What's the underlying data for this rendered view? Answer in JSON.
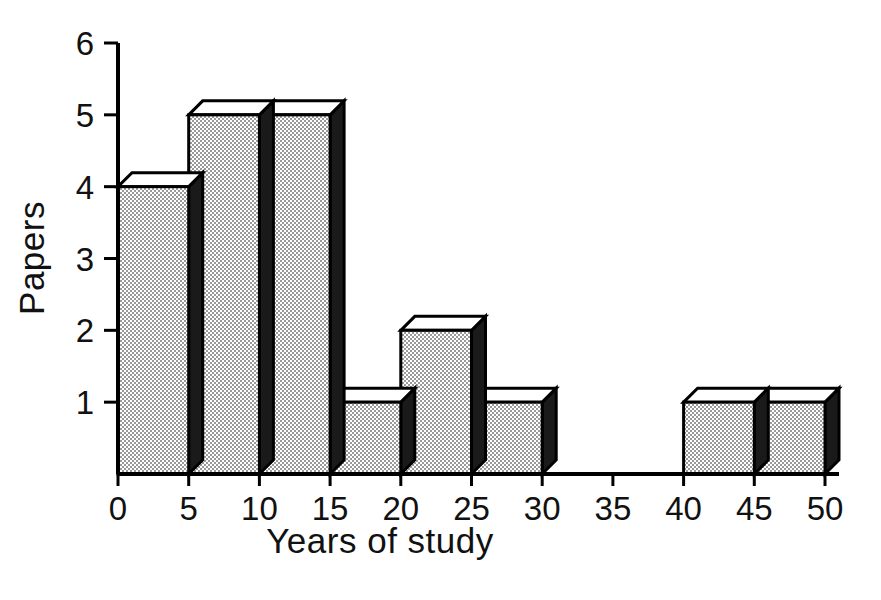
{
  "chart_data": {
    "type": "bar",
    "title": "",
    "subtitle": "",
    "xlabel": "Years of study",
    "ylabel": "Papers",
    "categories": [
      "0-5",
      "5-10",
      "10-15",
      "15-20",
      "20-25",
      "25-30",
      "30-35",
      "35-40",
      "40-45",
      "45-50"
    ],
    "bin_edges": [
      0,
      5,
      10,
      15,
      20,
      25,
      30,
      35,
      40,
      45,
      50
    ],
    "values": [
      4,
      5,
      5,
      1,
      2,
      1,
      0,
      0,
      1,
      1
    ],
    "x_tick_labels": [
      "0",
      "5",
      "10",
      "15",
      "20",
      "25",
      "30",
      "35",
      "40",
      "45",
      "50"
    ],
    "x_tick_values": [
      0,
      5,
      10,
      15,
      20,
      25,
      30,
      35,
      40,
      45,
      50
    ],
    "y_tick_labels": [
      "1",
      "2",
      "3",
      "4",
      "5",
      "6"
    ],
    "y_tick_values": [
      1,
      2,
      3,
      4,
      5,
      6
    ],
    "xlim": [
      0,
      50
    ],
    "ylim": [
      0,
      6
    ],
    "grid": false,
    "legend": false,
    "legend_position": "none",
    "style": "3d-extruded-bars",
    "colors": {
      "bar_front": "#d0d0d0",
      "bar_top": "#ffffff",
      "bar_side": "#1a1a1a",
      "outline": "#000000",
      "background": "#ffffff",
      "text": "#111111"
    },
    "annotations": []
  },
  "figure": {
    "background": "#ffffff",
    "width": 881,
    "height": 600
  }
}
